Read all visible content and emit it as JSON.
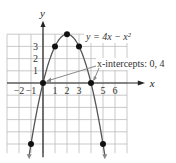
{
  "chart_data": {
    "type": "line",
    "title": "",
    "equation_label": "y = 4x − x²",
    "annotation": "x-intercepts: 0, 4",
    "xlabel": "x",
    "ylabel": "y",
    "x_ticks": [
      "−2",
      "−1",
      "1",
      "2",
      "3",
      "5",
      "6"
    ],
    "y_ticks": [
      "1",
      "2",
      "3"
    ],
    "xlim": [
      -3,
      7
    ],
    "ylim": [
      -6,
      4
    ],
    "grid": true,
    "points": [
      {
        "x": -1,
        "y": -5
      },
      {
        "x": 0,
        "y": 0
      },
      {
        "x": 1,
        "y": 3
      },
      {
        "x": 2,
        "y": 4
      },
      {
        "x": 3,
        "y": 3
      },
      {
        "x": 4,
        "y": 0
      },
      {
        "x": 5,
        "y": -5
      }
    ],
    "intercepts": [
      0,
      4
    ],
    "colors": {
      "curve": "#555555",
      "grid": "#bbbbbb",
      "point": "#111111",
      "arrow": "#888888"
    }
  }
}
